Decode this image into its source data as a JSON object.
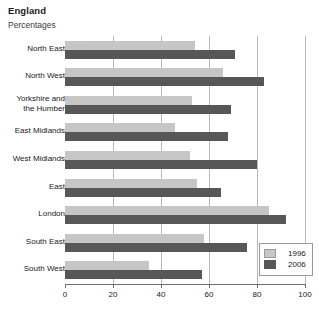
{
  "header": {
    "title": "England",
    "subtitle": "Percentages"
  },
  "legend": {
    "entries": [
      {
        "label": "1996",
        "color": "#c6c6c6"
      },
      {
        "label": "2006",
        "color": "#575757"
      }
    ]
  },
  "chart_data": {
    "type": "bar",
    "orientation": "horizontal",
    "title": "England",
    "subtitle": "Percentages",
    "xlabel": "",
    "ylabel": "",
    "xlim": [
      0,
      100
    ],
    "xticks": [
      0,
      20,
      40,
      60,
      80,
      100
    ],
    "xtick_labels": [
      "0",
      "20",
      "40",
      "60",
      "80",
      "100"
    ],
    "grid": "vertical",
    "legend_position": "bottom-right",
    "categories": [
      "North East",
      "North West",
      "Yorkshire and the Humber",
      "East Midlands",
      "West Midlands",
      "East",
      "London",
      "South East",
      "South West"
    ],
    "category_labels": [
      "North East",
      "North West",
      "Yorkshire and\nthe Humber",
      "East Midlands",
      "West Midlands",
      "East",
      "London",
      "South East",
      "South West"
    ],
    "series": [
      {
        "name": "1996",
        "color": "#c6c6c6",
        "values": [
          54,
          66,
          53,
          46,
          52,
          55,
          85,
          58,
          35
        ]
      },
      {
        "name": "2006",
        "color": "#575757",
        "values": [
          71,
          83,
          69,
          68,
          80,
          65,
          92,
          76,
          57
        ]
      }
    ]
  }
}
